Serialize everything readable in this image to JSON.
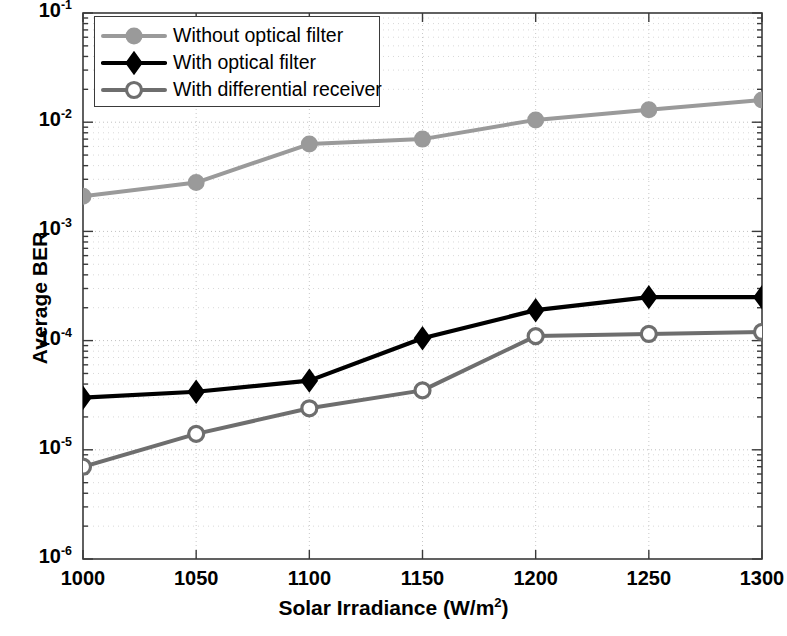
{
  "chart_data": {
    "type": "line",
    "title": "",
    "xlabel": "Solar Irradiance (W/m2)",
    "xlabel_base": "Solar Irradiance (W/m",
    "xlabel_sup": "2",
    "xlabel_tail": ")",
    "ylabel": "Average BER",
    "x": [
      1000,
      1050,
      1100,
      1150,
      1200,
      1250,
      1300
    ],
    "xticklabels": [
      "1000",
      "1050",
      "1100",
      "1150",
      "1200",
      "1250",
      "1300"
    ],
    "xlim": [
      1000,
      1300
    ],
    "ylim": [
      1e-06,
      0.1
    ],
    "yscale": "log",
    "yticks": [
      0.1,
      0.01,
      0.001,
      0.0001,
      1e-05,
      1e-06
    ],
    "yticklabels": [
      "10-1",
      "10-2",
      "10-3",
      "10-4",
      "10-5",
      "10-6"
    ],
    "ytick_exponents": [
      "-1",
      "-2",
      "-3",
      "-4",
      "-5",
      "-6"
    ],
    "ytick_mantissa": "10",
    "grid": true,
    "grid_style": "dotted",
    "legend_position": "top-left-inside",
    "series": [
      {
        "name": "Without optical filter",
        "color": "#9a9a9a",
        "marker": "circle-filled",
        "values": [
          0.0021,
          0.0028,
          0.0063,
          0.007,
          0.0105,
          0.013,
          0.016
        ]
      },
      {
        "name": "With optical filter",
        "color": "#000000",
        "marker": "diamond",
        "values": [
          3e-05,
          3.4e-05,
          4.3e-05,
          0.000105,
          0.00019,
          0.00025,
          0.00025
        ]
      },
      {
        "name": "With differential receiver",
        "color": "#6e6e6e",
        "marker": "circle-open",
        "values": [
          7e-06,
          1.4e-05,
          2.4e-05,
          3.5e-05,
          0.00011,
          0.000115,
          0.00012
        ]
      }
    ]
  },
  "legend": {
    "items": [
      {
        "label": "Without optical filter"
      },
      {
        "label": "With optical filter"
      },
      {
        "label": "With differential receiver"
      }
    ]
  }
}
